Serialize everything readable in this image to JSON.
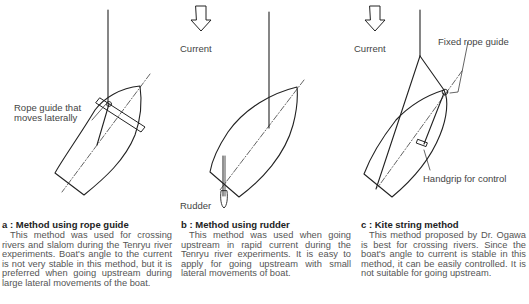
{
  "figures": [
    {
      "id": "a",
      "labels": {
        "rope_guide": "Rope guide that\nmoves laterally"
      },
      "caption": {
        "title": "a : Method using rope guide",
        "body": "This method was used for crossing rivers and slalom during  the Tenryu river experiments. Boat's angle to the current is not very stable in this method, but it is preferred when going upstream during large lateral movements of the boat."
      }
    },
    {
      "id": "b",
      "labels": {
        "current": "Current",
        "rudder": "Rudder"
      },
      "caption": {
        "title": "b : Method using rudder",
        "body": "This method was used when going  upstream in rapid current during the Tenryu river experiments. It is easy to apply for going upstream with small lateral movements of boat."
      }
    },
    {
      "id": "c",
      "labels": {
        "current": "Current",
        "fixed_rope_guide": "Fixed rope guide",
        "handgrip": "Handgrip for control"
      },
      "caption": {
        "title": "c : Kite string method",
        "body": "This method proposed by Dr. Ogawa is best for crossing rivers. Since the boat's angle to current is stable in this method, it can be easily controlled. It is not suitable for going upstream."
      }
    }
  ],
  "colors": {
    "line": "#222222",
    "text": "#444444",
    "caption_body": "#555555"
  }
}
